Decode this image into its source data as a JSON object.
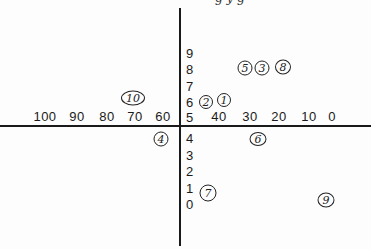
{
  "diagram": {
    "type": "hand-annotated coordinate axes",
    "top_cutoff_text": "g      y      g",
    "x_axis": {
      "left_labels": [
        {
          "text": "100",
          "x": 45
        },
        {
          "text": "90",
          "x": 77
        },
        {
          "text": "80",
          "x": 107
        },
        {
          "text": "70",
          "x": 135
        },
        {
          "text": "60",
          "x": 163
        }
      ],
      "right_labels": [
        {
          "text": "40",
          "x": 219
        },
        {
          "text": "30",
          "x": 250
        },
        {
          "text": "20",
          "x": 279
        },
        {
          "text": "10",
          "x": 309
        },
        {
          "text": "0",
          "x": 332
        }
      ]
    },
    "y_axis": {
      "labels": [
        {
          "text": "9",
          "y": 47
        },
        {
          "text": "8",
          "y": 63
        },
        {
          "text": "7",
          "y": 80
        },
        {
          "text": "6",
          "y": 96
        },
        {
          "text": "5",
          "y": 111
        },
        {
          "text": "4",
          "y": 132
        },
        {
          "text": "3",
          "y": 149
        },
        {
          "text": "2",
          "y": 165
        },
        {
          "text": "1",
          "y": 182
        },
        {
          "text": "0",
          "y": 198
        }
      ]
    },
    "circled_points": [
      {
        "label": "10",
        "x": 133,
        "y": 98,
        "w": 24,
        "h": 15
      },
      {
        "label": "2",
        "x": 206,
        "y": 102,
        "w": 14,
        "h": 14
      },
      {
        "label": "1",
        "x": 224,
        "y": 100,
        "w": 14,
        "h": 14
      },
      {
        "label": "5",
        "x": 245,
        "y": 68,
        "w": 15,
        "h": 15
      },
      {
        "label": "3",
        "x": 262,
        "y": 68,
        "w": 15,
        "h": 15
      },
      {
        "label": "8",
        "x": 283,
        "y": 67,
        "w": 16,
        "h": 15
      },
      {
        "label": "4",
        "x": 161,
        "y": 139,
        "w": 15,
        "h": 15
      },
      {
        "label": "6",
        "x": 258,
        "y": 139,
        "w": 17,
        "h": 14
      },
      {
        "label": "7",
        "x": 208,
        "y": 193,
        "w": 17,
        "h": 17
      },
      {
        "label": "9",
        "x": 326,
        "y": 200,
        "w": 17,
        "h": 15
      }
    ]
  }
}
